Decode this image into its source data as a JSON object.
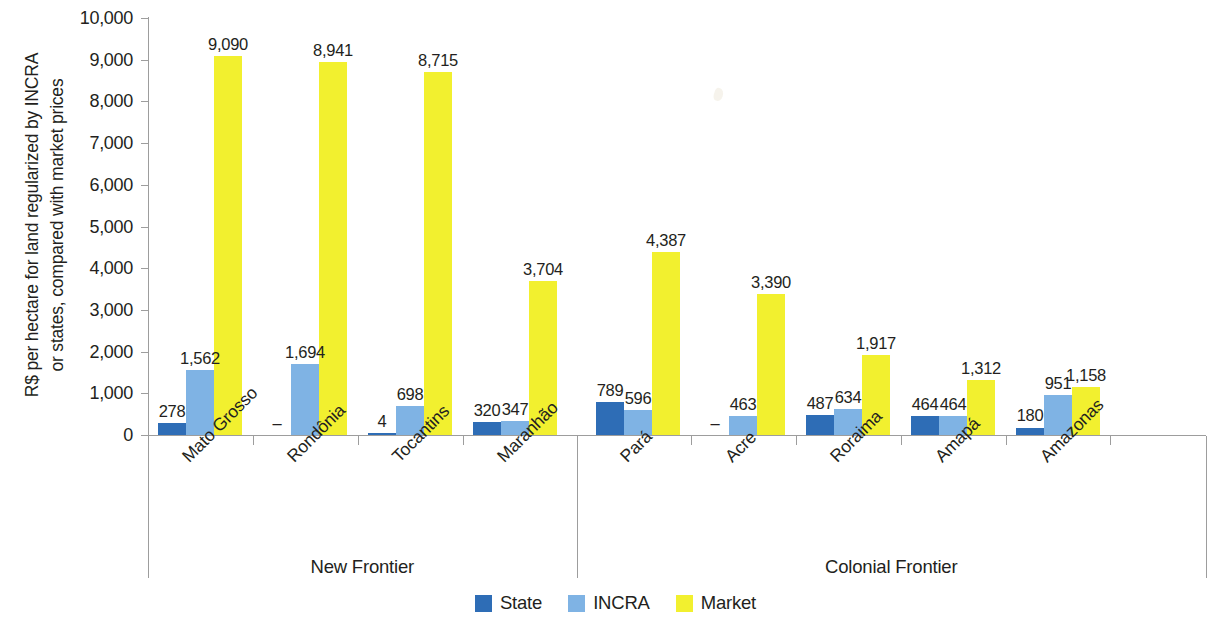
{
  "chart_data": {
    "type": "bar",
    "title": "",
    "subtitle": "",
    "ylabel": "R$ per hectare for land regularized by INCRA\nor states, compared with market prices",
    "xlabel": "",
    "ylim": [
      0,
      10000
    ],
    "ytick_labels": [
      "10,000",
      "9,000",
      "8,000",
      "7,000",
      "6,000",
      "5,000",
      "4,000",
      "3,000",
      "2,000",
      "1,000",
      "0"
    ],
    "ytick_values": [
      10000,
      9000,
      8000,
      7000,
      6000,
      5000,
      4000,
      3000,
      2000,
      1000,
      0
    ],
    "grid": false,
    "legend_position": "bottom",
    "categories": [
      "Mato Grosso",
      "Rondônia",
      "Tocantins",
      "Maranhão",
      "Pará",
      "Acre",
      "Roraima",
      "Amapá",
      "Amazonas"
    ],
    "groups": [
      {
        "name": "New Frontier",
        "categories": [
          "Mato Grosso",
          "Rondônia",
          "Tocantins",
          "Maranhão"
        ]
      },
      {
        "name": "Colonial Frontier",
        "categories": [
          "Pará",
          "Acre",
          "Roraima",
          "Amapá",
          "Amazonas"
        ]
      }
    ],
    "series": [
      {
        "name": "State",
        "color": "#2e6db6",
        "values": [
          278,
          null,
          4,
          320,
          789,
          null,
          487,
          464,
          180
        ],
        "labels": [
          "278",
          "–",
          "4",
          "320",
          "789",
          "–",
          "487",
          "464",
          "180"
        ]
      },
      {
        "name": "INCRA",
        "color": "#7fb3e4",
        "values": [
          1562,
          1694,
          698,
          347,
          596,
          463,
          634,
          464,
          951
        ],
        "labels": [
          "1,562",
          "1,694",
          "698",
          "347",
          "596",
          "463",
          "634",
          "464",
          "951"
        ]
      },
      {
        "name": "Market",
        "color": "#f2f02f",
        "values": [
          9090,
          8941,
          8715,
          3704,
          4387,
          3390,
          1917,
          1312,
          1158
        ],
        "labels": [
          "9,090",
          "8,941",
          "8,715",
          "3,704",
          "4,387",
          "3,390",
          "1,917",
          "1,312",
          "1,158"
        ]
      }
    ]
  },
  "legend": {
    "items": [
      {
        "label": "State",
        "color": "#2e6db6"
      },
      {
        "label": "INCRA",
        "color": "#7fb3e4"
      },
      {
        "label": "Market",
        "color": "#f2f02f"
      }
    ]
  }
}
